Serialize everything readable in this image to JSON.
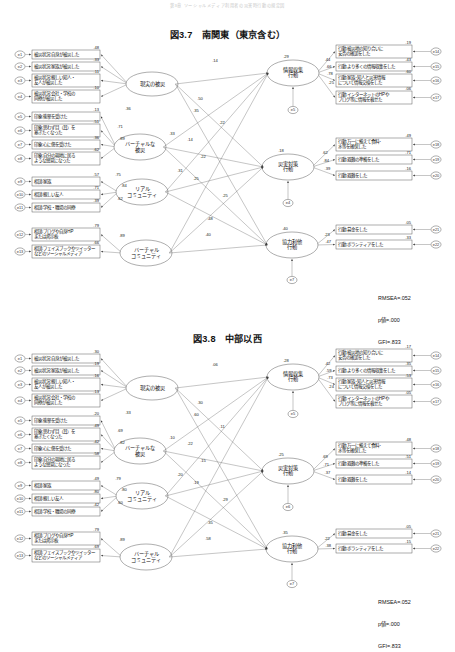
{
  "page": {
    "running_head": "第3章 ソーシャルメディア利用者の災害時行動の規定因"
  },
  "figures": [
    {
      "id": "fig-3-7",
      "number": "図3.7",
      "title": "南関東（東京含む）",
      "fit": {
        "rmsea": "RMSEA=.052",
        "pvalue": "p値=.000",
        "gfi": "GFI=.833"
      },
      "observed_left": [
        {
          "err": "e1",
          "label": [
            "被災状況:自身が被災した"
          ],
          "coef": ".48"
        },
        {
          "err": "e2",
          "label": [
            "被災状況:家族が被災した"
          ],
          "coef": ".33"
        },
        {
          "err": "e3",
          "label": [
            "被災状況:親しい知人・",
            "友人が被災した"
          ],
          "coef": ".11"
        },
        {
          "err": "e4",
          "label": [
            "被災状況:会社・学校の",
            "同僚が被災した"
          ],
          "coef": ".10"
        },
        {
          "err": "e5",
          "label": [
            "印象:衝撃を受けた"
          ],
          "coef": ".13"
        },
        {
          "err": "e6",
          "label": [
            "印象:思わず目（耳）を",
            "塞ぎたくなった"
          ],
          "coef": ".51"
        },
        {
          "err": "e7",
          "label": [
            "印象:心に傷を受けた"
          ],
          "coef": ".36"
        },
        {
          "err": "e8",
          "label": [
            "印象:自分の現地に居る",
            "ような感覚になった"
          ],
          "coef": ".62"
        },
        {
          "err": "e9",
          "label": [
            "相談:家族"
          ],
          "coef": ".57"
        },
        {
          "err": "e10",
          "label": [
            "相談:親しい友人"
          ],
          "coef": ".71"
        },
        {
          "err": "e11",
          "label": [
            "相談:学校・職場の同僚"
          ],
          "coef": ".39"
        },
        {
          "err": "e12",
          "label": [
            "相談:ブログや自身HP",
            "または掲示板"
          ],
          "coef": ".79"
        },
        {
          "err": "e13",
          "label": [
            "相談:フェイスブックやツイッター",
            "などのソーシャルメディア"
          ],
          "coef": ".66"
        }
      ],
      "observed_right": [
        {
          "err": "e14",
          "label": [
            "行動:被災地の知り合いに",
            "安否の確認をした"
          ],
          "coef": ".19"
        },
        {
          "err": "e15",
          "label": [
            "行動:より多くの情報収集をした"
          ],
          "coef": ".43"
        },
        {
          "err": "e16",
          "label": [
            "行動:家族･知人と災害情報",
            "について情報交換をした"
          ],
          "coef": ".60"
        },
        {
          "err": "e17",
          "label": [
            "行動:インターネットのHPや",
            "ブログ等に情報を載せた"
          ],
          "coef": ".06"
        },
        {
          "err": "e18",
          "label": [
            "行動:万一に備えて食料･",
            "水等を確保した"
          ],
          "coef": ".49"
        },
        {
          "err": "e19",
          "label": [
            "行動:避難の準備をした"
          ],
          "coef": ".71"
        },
        {
          "err": "e20",
          "label": [
            "行動:避難をした"
          ],
          "coef": ".16"
        },
        {
          "err": "e21",
          "label": [
            "行動:募金をした"
          ],
          "coef": ".05"
        },
        {
          "err": "e22",
          "label": [
            "行動:ボランティアをした"
          ],
          "coef": ".33"
        }
      ],
      "latent_left": [
        {
          "id": "L1",
          "label": [
            "現実の被災"
          ]
        },
        {
          "id": "L2",
          "label": [
            "バーチャルな",
            "被災"
          ]
        },
        {
          "id": "L3",
          "label": [
            "リアル",
            "コミュニティ"
          ]
        },
        {
          "id": "L4",
          "label": [
            "バーチャル",
            "コミュニティ"
          ]
        }
      ],
      "latent_right": [
        {
          "id": "R1",
          "label": [
            "情報収集",
            "行動"
          ],
          "err": "e5",
          "disturb_coef": ".29",
          "sub_coefs": [
            ".44",
            ".66",
            ".78",
            ".25"
          ]
        },
        {
          "id": "R2",
          "label": [
            "災害対策",
            "行動"
          ],
          "err": "e4",
          "disturb_coef": ".18",
          "sub_coefs": [
            ".62",
            ".84",
            ".39"
          ]
        },
        {
          "id": "R3",
          "label": [
            "協力利他",
            "行動"
          ],
          "err": "e7",
          "disturb_coef": ".40",
          "sub_coefs": [
            ".23",
            ".47"
          ]
        }
      ],
      "measure_right_coefs": [
        ".44",
        ".66",
        ".78",
        ".25",
        ".62",
        ".84",
        ".39",
        ".23",
        ".47"
      ],
      "structural": [
        {
          "from": "L1",
          "to": "R1",
          "value": ".14"
        },
        {
          "from": "L1",
          "to": "R2",
          "value": ".22"
        },
        {
          "from": "L1",
          "to": "R3",
          "value": ".25"
        },
        {
          "from": "L2",
          "to": "R1",
          "value": ".50"
        },
        {
          "from": "L2",
          "to": "R2",
          "value": ".14"
        },
        {
          "from": "L2",
          "to": "R3",
          "value": ".25"
        },
        {
          "from": "L3",
          "to": "R1",
          "value": ".35"
        },
        {
          "from": "L3",
          "to": "R2",
          "value": ".22"
        },
        {
          "from": "L3",
          "to": "R3",
          "value": ".48"
        },
        {
          "from": "L4",
          "to": "R1",
          "value": ".33"
        },
        {
          "from": "L4",
          "to": "R2",
          "value": ".31"
        },
        {
          "from": "L4",
          "to": "R3",
          "value": ".40"
        }
      ],
      "left_loadings_extra": [
        ".36",
        ".71",
        ".89",
        ".75",
        ".84",
        ".62",
        ".89"
      ]
    },
    {
      "id": "fig-3-8",
      "number": "図3.8",
      "title": "中部以西",
      "fit": {
        "rmsea": "RMSEA=.052",
        "pvalue": "p値=.000",
        "gfi": "GFI=.833"
      },
      "observed_left": [
        {
          "err": "e1",
          "label": [
            "被災状況:自身が被災した"
          ],
          "coef": ".30"
        },
        {
          "err": "e2",
          "label": [
            "被災状況:家族が被災した"
          ],
          "coef": ".19"
        },
        {
          "err": "e3",
          "label": [
            "被災状況:親しい知人・",
            "友人が被災した"
          ],
          "coef": ".16"
        },
        {
          "err": "e4",
          "label": [
            "被災状況:会社・学校の",
            "同僚が被災した"
          ],
          "coef": ".13"
        },
        {
          "err": "e5",
          "label": [
            "印象:衝撃を受けた"
          ],
          "coef": ".20"
        },
        {
          "err": "e6",
          "label": [
            "印象:思わず目（耳）を",
            "塞ぎたくなった"
          ],
          "coef": ".49"
        },
        {
          "err": "e7",
          "label": [
            "印象:心に傷を受けた"
          ],
          "coef": ".42"
        },
        {
          "err": "e8",
          "label": [
            "印象:自分の現地に居る",
            "ような感覚になった"
          ],
          "coef": ".58"
        },
        {
          "err": "e9",
          "label": [
            "相談:家族"
          ],
          "coef": ".49"
        },
        {
          "err": "e10",
          "label": [
            "相談:親しい友人"
          ],
          "coef": ".80"
        },
        {
          "err": "e11",
          "label": [
            "相談:学校・職場の同僚"
          ],
          "coef": ".42"
        },
        {
          "err": "e12",
          "label": [
            "相談:ブログや自身HP",
            "または掲示板"
          ],
          "coef": ".79"
        },
        {
          "err": "e13",
          "label": [
            "相談:フェイスブックやツイッター",
            "などのソーシャルメディア"
          ],
          "coef": ".69"
        }
      ],
      "observed_right": [
        {
          "err": "e14",
          "label": [
            "行動:被災地の知り合いに",
            "安否の確認をした"
          ],
          "coef": ".17"
        },
        {
          "err": "e15",
          "label": [
            "行動:より多くの情報収集をした"
          ],
          "coef": ".35"
        },
        {
          "err": "e16",
          "label": [
            "行動:家族･知人と災害情報",
            "について情報交換をした"
          ],
          "coef": ".53"
        },
        {
          "err": "e17",
          "label": [
            "行動:インターネットのHPや",
            "ブログ等に情報を載せた"
          ],
          "coef": ".05"
        },
        {
          "err": "e18",
          "label": [
            "行動:万一に備えて食料･",
            "水等を確保した"
          ],
          "coef": ".48"
        },
        {
          "err": "e19",
          "label": [
            "行動:避難の準備をした"
          ],
          "coef": ".51"
        },
        {
          "err": "e20",
          "label": [
            "行動:避難をした"
          ],
          "coef": ".14"
        },
        {
          "err": "e21",
          "label": [
            "行動:募金をした"
          ],
          "coef": ".05"
        },
        {
          "err": "e22",
          "label": [
            "行動:ボランティアをした"
          ],
          "coef": ".15"
        }
      ],
      "latent_left": [
        {
          "id": "L1",
          "label": [
            "現実の被災"
          ]
        },
        {
          "id": "L2",
          "label": [
            "バーチャルな",
            "被災"
          ]
        },
        {
          "id": "L3",
          "label": [
            "リアル",
            "コミュニティ"
          ]
        },
        {
          "id": "L4",
          "label": [
            "バーチャル",
            "コミュニティ"
          ]
        }
      ],
      "latent_right": [
        {
          "id": "R1",
          "label": [
            "情報収集",
            "行動"
          ],
          "err": "e5",
          "disturb_coef": ".28",
          "sub_coefs": [
            ".42",
            ".59",
            ".73",
            ".24"
          ]
        },
        {
          "id": "R2",
          "label": [
            "災害対策",
            "行動"
          ],
          "err": "e6",
          "disturb_coef": ".25",
          "sub_coefs": [
            ".69",
            ".71",
            ".37"
          ]
        },
        {
          "id": "R3",
          "label": [
            "協力利他",
            "行動"
          ],
          "err": "e7",
          "disturb_coef": ".35",
          "sub_coefs": [
            ".22",
            ".38"
          ]
        }
      ],
      "measure_right_coefs": [
        ".42",
        ".59",
        ".73",
        ".24",
        ".69",
        ".71",
        ".37",
        ".22",
        ".38"
      ],
      "structural": [
        {
          "from": "L1",
          "to": "R1",
          "value": ".06"
        },
        {
          "from": "L1",
          "to": "R2",
          "value": ".11"
        },
        {
          "from": "L1",
          "to": "R3",
          "value": ".29"
        },
        {
          "from": "L2",
          "to": "R1",
          "value": ".30"
        },
        {
          "from": "L2",
          "to": "R2",
          "value": ".22"
        },
        {
          "from": "L2",
          "to": "R3",
          "value": ".19"
        },
        {
          "from": "L3",
          "to": "R1",
          "value": ".60"
        },
        {
          "from": "L3",
          "to": "R2",
          "value": ".15"
        },
        {
          "from": "L3",
          "to": "R3",
          "value": ".35"
        },
        {
          "from": "L4",
          "to": "R1",
          "value": ".10"
        },
        {
          "from": "L4",
          "to": "R2",
          "value": ".20"
        },
        {
          "from": "L4",
          "to": "R3",
          "value": ".58"
        }
      ],
      "left_loadings_extra": [
        ".33",
        ".69",
        ".82",
        ".79",
        ".80",
        ".60",
        ".89"
      ]
    }
  ]
}
